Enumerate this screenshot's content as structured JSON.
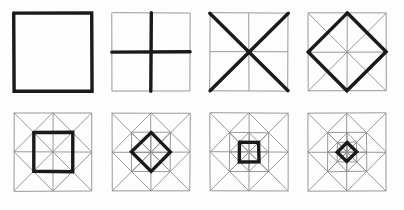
{
  "document": {
    "title": "Geometric Construction Sequence",
    "description": "Eight square panels in two rows of four showing the step-by-step construction of a nested octagram quilt-block pattern.",
    "background_color": "#fdfdfd",
    "canvas": {
      "width": 404,
      "height": 210
    }
  },
  "style": {
    "thin_stroke_color": "#8d8d8d",
    "thin_stroke_width": 0.9,
    "thick_stroke_color": "#1a1a1a",
    "thick_stroke_width": 3.4,
    "frame_stroke_color": "#8d8d8d"
  },
  "grid": {
    "rows": 2,
    "columns": 4,
    "panel_size": 78,
    "row_tops": [
      13,
      113
    ],
    "column_lefts": [
      14,
      112,
      210,
      308
    ]
  },
  "panels": [
    {
      "index": 1,
      "name": "outer-square",
      "label": "1",
      "emphasis": "square",
      "thin_layers": [],
      "thick_layers": [
        "square-0"
      ],
      "depth": 0
    },
    {
      "index": 2,
      "name": "cross",
      "label": "2",
      "emphasis": "cross",
      "thin_layers": [
        "square-0"
      ],
      "thick_layers": [
        "cross-0"
      ],
      "depth": 0
    },
    {
      "index": 3,
      "name": "diagonals",
      "label": "3",
      "emphasis": "diagonals",
      "thin_layers": [
        "square-0",
        "cross-0"
      ],
      "thick_layers": [
        "diagonals-0"
      ],
      "depth": 0
    },
    {
      "index": 4,
      "name": "diamond",
      "label": "4",
      "emphasis": "diamond",
      "thin_layers": [
        "square-0",
        "cross-0",
        "diagonals-0"
      ],
      "thick_layers": [
        "diamond-0"
      ],
      "depth": 0
    },
    {
      "index": 5,
      "name": "inner-square",
      "label": "5",
      "emphasis": "square",
      "thin_layers": [
        "square-0",
        "cross-0",
        "diagonals-0",
        "diamond-0"
      ],
      "thick_layers": [
        "square-1"
      ],
      "depth": 1
    },
    {
      "index": 6,
      "name": "inner-diamond",
      "label": "6",
      "emphasis": "diamond",
      "thin_layers": [
        "square-0",
        "cross-0",
        "diagonals-0",
        "diamond-0",
        "square-1",
        "cross-1",
        "diagonals-1"
      ],
      "thick_layers": [
        "diamond-1"
      ],
      "depth": 1
    },
    {
      "index": 7,
      "name": "inner-square-2",
      "label": "7",
      "emphasis": "square",
      "thin_layers": [
        "square-0",
        "cross-0",
        "diagonals-0",
        "diamond-0",
        "square-1",
        "cross-1",
        "diagonals-1",
        "diamond-1"
      ],
      "thick_layers": [
        "square-2"
      ],
      "depth": 2
    },
    {
      "index": 8,
      "name": "inner-diamond-2",
      "label": "8",
      "emphasis": "diamond",
      "thin_layers": [
        "square-0",
        "cross-0",
        "diagonals-0",
        "diamond-0",
        "square-1",
        "cross-1",
        "diagonals-1",
        "diamond-1",
        "square-2",
        "cross-2",
        "diagonals-2"
      ],
      "thick_layers": [
        "diamond-2"
      ],
      "depth": 2
    }
  ],
  "geometry_notes": {
    "square": "Axis-aligned square centred on the panel centre.",
    "cross": "Horizontal and vertical midlines of the current square.",
    "diagonals": "Both corner-to-corner diagonals of the current square.",
    "diamond": "Rotated square joining the midpoints of the current square's edges.",
    "recursion": "Each diamond's inscribed axis-aligned square is half the size of its parent square, producing the next depth level."
  }
}
